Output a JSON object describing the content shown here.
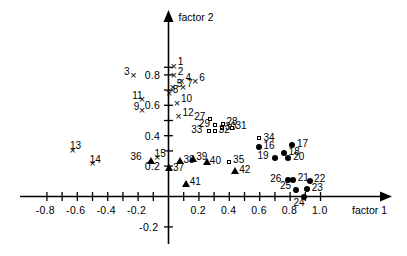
{
  "figure": {
    "kind": "factor-analysis-scatter",
    "axis_x_name": "factor 1",
    "axis_y_name": "factor 2"
  },
  "chart_data": {
    "type": "scatter",
    "title": "",
    "xlabel": "factor 1",
    "ylabel": "factor 2",
    "xlim": [
      -0.88,
      1.12
    ],
    "ylim": [
      -0.28,
      0.95
    ],
    "xticks": [
      -0.8,
      -0.7,
      -0.6,
      -0.5,
      -0.4,
      -0.3,
      -0.2,
      -0.1,
      0.1,
      0.2,
      0.3,
      0.4,
      0.5,
      0.6,
      0.7,
      0.8,
      0.9,
      1.0
    ],
    "xticklabels": [
      {
        "value": -0.8,
        "text": "-0.8"
      },
      {
        "value": -0.6,
        "text": "-0.6"
      },
      {
        "value": -0.4,
        "text": "-0.4"
      },
      {
        "value": -0.2,
        "text": "-0.2"
      },
      {
        "value": 0.2,
        "text": "0.2"
      },
      {
        "value": 0.4,
        "text": "0.4"
      },
      {
        "value": 0.6,
        "text": "0.6"
      },
      {
        "value": 0.8,
        "text": "0.8"
      },
      {
        "value": 1.0,
        "text": "1.0"
      }
    ],
    "yticks": [
      -0.2,
      0.2,
      0.3,
      0.4,
      0.5,
      0.6,
      0.7,
      0.8,
      0.85
    ],
    "yticklabels": [
      {
        "value": 0.8,
        "text": "0.8"
      },
      {
        "value": 0.6,
        "text": "0.6"
      },
      {
        "value": 0.4,
        "text": "0.4"
      },
      {
        "value": 0.2,
        "text": "0.2"
      },
      {
        "value": -0.2,
        "text": "-0.2"
      }
    ],
    "grid": false,
    "legend": "none",
    "series": [
      {
        "name": "group-x",
        "marker": "x",
        "points": [
          {
            "label": "1",
            "x": 0.035,
            "y": 0.855,
            "lx": 0.055,
            "ly": 0.885
          },
          {
            "label": "2",
            "x": 0.035,
            "y": 0.795,
            "lx": 0.055,
            "ly": 0.822
          },
          {
            "label": "3",
            "x": -0.23,
            "y": 0.795,
            "lx": -0.3,
            "ly": 0.822
          },
          {
            "label": "4",
            "x": 0.085,
            "y": 0.755,
            "lx": 0.105,
            "ly": 0.782
          },
          {
            "label": "5",
            "x": 0.028,
            "y": 0.715,
            "lx": 0.048,
            "ly": 0.742
          },
          {
            "label": "6",
            "x": 0.175,
            "y": 0.755,
            "lx": 0.195,
            "ly": 0.782
          },
          {
            "label": "7",
            "x": 0.095,
            "y": 0.715,
            "lx": 0.115,
            "ly": 0.742
          },
          {
            "label": "8",
            "x": 0.005,
            "y": 0.675,
            "lx": 0.022,
            "ly": 0.702
          },
          {
            "label": "9",
            "x": -0.175,
            "y": 0.565,
            "lx": -0.235,
            "ly": 0.592
          },
          {
            "label": "10",
            "x": 0.055,
            "y": 0.615,
            "lx": 0.075,
            "ly": 0.642
          },
          {
            "label": "11",
            "x": -0.175,
            "y": 0.635,
            "lx": -0.245,
            "ly": 0.662
          },
          {
            "label": "12",
            "x": 0.065,
            "y": 0.525,
            "lx": 0.085,
            "ly": 0.552
          },
          {
            "label": "13",
            "x": -0.63,
            "y": 0.305,
            "lx": -0.655,
            "ly": 0.332
          },
          {
            "label": "14",
            "x": -0.5,
            "y": 0.215,
            "lx": -0.525,
            "ly": 0.242
          },
          {
            "label": "15",
            "x": -0.075,
            "y": 0.255,
            "lx": -0.098,
            "ly": 0.282
          }
        ]
      },
      {
        "name": "group-circle",
        "marker": "circle",
        "points": [
          {
            "label": "16",
            "x": 0.595,
            "y": 0.325,
            "lx": 0.625,
            "ly": 0.335
          },
          {
            "label": "17",
            "x": 0.815,
            "y": 0.335,
            "lx": 0.845,
            "ly": 0.345
          },
          {
            "label": "18",
            "x": 0.76,
            "y": 0.285,
            "lx": 0.79,
            "ly": 0.295
          },
          {
            "label": "19",
            "x": 0.7,
            "y": 0.255,
            "lx": 0.64,
            "ly": 0.268
          },
          {
            "label": "20",
            "x": 0.79,
            "y": 0.25,
            "lx": 0.82,
            "ly": 0.26
          },
          {
            "label": "21",
            "x": 0.82,
            "y": 0.105,
            "lx": 0.85,
            "ly": 0.12
          },
          {
            "label": "22",
            "x": 0.93,
            "y": 0.1,
            "lx": 0.958,
            "ly": 0.112
          },
          {
            "label": "23",
            "x": 0.915,
            "y": 0.045,
            "lx": 0.942,
            "ly": 0.055
          },
          {
            "label": "24",
            "x": 0.895,
            "y": -0.002,
            "lx": 0.878,
            "ly": -0.045
          },
          {
            "label": "25",
            "x": 0.84,
            "y": 0.04,
            "lx": 0.788,
            "ly": 0.07
          },
          {
            "label": "26",
            "x": 0.785,
            "y": 0.105,
            "lx": 0.725,
            "ly": 0.118
          }
        ]
      },
      {
        "name": "group-square",
        "marker": "square",
        "points": [
          {
            "label": "27",
            "x": 0.28,
            "y": 0.505,
            "lx": 0.225,
            "ly": 0.522
          },
          {
            "label": "28",
            "x": 0.36,
            "y": 0.475,
            "lx": 0.382,
            "ly": 0.492
          },
          {
            "label": "29",
            "x": 0.312,
            "y": 0.465,
            "lx": 0.255,
            "ly": 0.478
          },
          {
            "label": "30",
            "x": 0.355,
            "y": 0.445,
            "lx": 0.372,
            "ly": 0.455
          },
          {
            "label": "31",
            "x": 0.42,
            "y": 0.45,
            "lx": 0.44,
            "ly": 0.462
          },
          {
            "label": "32",
            "x": 0.312,
            "y": 0.428,
            "lx": 0.33,
            "ly": 0.438
          },
          {
            "label": "33",
            "x": 0.272,
            "y": 0.428,
            "lx": 0.205,
            "ly": 0.44
          },
          {
            "label": "34",
            "x": 0.6,
            "y": 0.378,
            "lx": 0.625,
            "ly": 0.388
          },
          {
            "label": "35",
            "x": 0.4,
            "y": 0.225,
            "lx": 0.425,
            "ly": 0.238
          }
        ]
      },
      {
        "name": "group-triangle",
        "marker": "triangle",
        "points": [
          {
            "label": "36",
            "x": -0.115,
            "y": 0.235,
            "lx": -0.195,
            "ly": 0.262
          },
          {
            "label": "37",
            "x": 0.005,
            "y": 0.185,
            "lx": 0.03,
            "ly": 0.188
          },
          {
            "label": "38",
            "x": 0.075,
            "y": 0.235,
            "lx": 0.098,
            "ly": 0.242
          },
          {
            "label": "39",
            "x": 0.16,
            "y": 0.248,
            "lx": 0.182,
            "ly": 0.258
          },
          {
            "label": "40",
            "x": 0.25,
            "y": 0.228,
            "lx": 0.272,
            "ly": 0.235
          },
          {
            "label": "41",
            "x": 0.115,
            "y": 0.085,
            "lx": 0.14,
            "ly": 0.095
          },
          {
            "label": "42",
            "x": 0.44,
            "y": 0.165,
            "lx": 0.465,
            "ly": 0.175
          }
        ]
      }
    ]
  }
}
